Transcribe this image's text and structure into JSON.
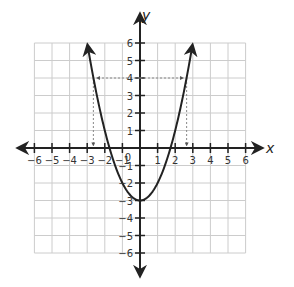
{
  "chart_data": {
    "type": "line",
    "title": "",
    "function": "y = x^2 - 3",
    "xlabel": "x",
    "ylabel": "y",
    "xlim": [
      -6,
      6
    ],
    "ylim": [
      -6,
      6
    ],
    "grid": true,
    "x_ticks": [
      -6,
      -5,
      -4,
      -3,
      -2,
      -1,
      0,
      1,
      2,
      3,
      4,
      5,
      6
    ],
    "y_ticks": [
      -6,
      -5,
      -4,
      -3,
      -2,
      -1,
      1,
      2,
      3,
      4,
      5,
      6
    ],
    "origin_label": "0",
    "series": [
      {
        "name": "parabola",
        "x": [
          -2.95,
          -2.65,
          -2,
          -1.73,
          -1,
          0,
          1,
          1.73,
          2,
          2.65,
          2.95
        ],
        "y": [
          5.7,
          4.0,
          1.0,
          0.0,
          -2.0,
          -3.0,
          -2.0,
          0.0,
          1.0,
          4.0,
          5.7
        ]
      }
    ],
    "annotations": [
      {
        "type": "dashed-horizontal",
        "y": 4,
        "x_from": -2.65,
        "x_to": 2.65,
        "note": "dashed line at y=4 with arrows pointing to curve"
      },
      {
        "type": "dashed-vertical",
        "x": -2.65,
        "y_from": 4,
        "y_to": 0,
        "note": "arrow down to x-axis"
      },
      {
        "type": "dashed-vertical",
        "x": 2.65,
        "y_from": 4,
        "y_to": 0,
        "note": "arrow down to x-axis"
      }
    ],
    "vertex": [
      0,
      -3
    ]
  },
  "colors": {
    "curve": "#222222",
    "axis": "#222222",
    "grid": "#cccccc",
    "dashed": "#888888"
  }
}
